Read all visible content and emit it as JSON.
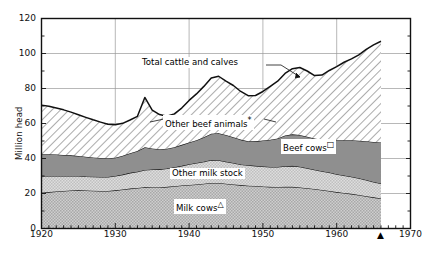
{
  "chart_data": {
    "type": "area",
    "stacked": true,
    "title": "",
    "xlabel": "",
    "ylabel": "Million head",
    "xlim": [
      1920,
      1970
    ],
    "ylim": [
      0,
      120
    ],
    "ytick_step": 20,
    "yminor_step": 10,
    "xtick_step": 10,
    "xminor_step": 1,
    "grid": "major xy",
    "legend_position": "inline-annotations",
    "x": [
      1920,
      1921,
      1922,
      1923,
      1924,
      1925,
      1926,
      1927,
      1928,
      1929,
      1930,
      1931,
      1932,
      1933,
      1934,
      1935,
      1936,
      1937,
      1938,
      1939,
      1940,
      1941,
      1942,
      1943,
      1944,
      1945,
      1946,
      1947,
      1948,
      1949,
      1950,
      1951,
      1952,
      1953,
      1954,
      1955,
      1956,
      1957,
      1958,
      1959,
      1960,
      1961,
      1962,
      1963,
      1964,
      1965,
      1966
    ],
    "series": [
      {
        "name": "Milk cows",
        "symbol": "triangle",
        "fill": "#bdbdbd",
        "values": [
          20.5,
          20.8,
          21.2,
          21.5,
          21.7,
          21.8,
          21.7,
          21.6,
          21.5,
          21.5,
          21.8,
          22.3,
          22.8,
          23.2,
          23.6,
          23.5,
          23.5,
          23.8,
          24.2,
          24.6,
          24.9,
          25.2,
          25.6,
          26.0,
          26.0,
          25.6,
          25.2,
          24.8,
          24.5,
          24.3,
          24.0,
          23.8,
          23.7,
          23.8,
          23.8,
          23.5,
          23.0,
          22.6,
          22.0,
          21.5,
          20.8,
          20.3,
          19.8,
          19.2,
          18.5,
          17.8,
          17.2
        ]
      },
      {
        "name": "Other milk stock",
        "symbol": "",
        "fill": "#d4d4d4",
        "values": [
          9.5,
          9.2,
          8.8,
          8.5,
          8.3,
          8.2,
          8.0,
          8.0,
          8.0,
          8.0,
          8.2,
          8.5,
          9.0,
          9.3,
          9.8,
          10.2,
          10.3,
          10.5,
          10.8,
          11.2,
          11.8,
          12.2,
          12.6,
          13.2,
          13.0,
          12.6,
          12.2,
          11.8,
          11.6,
          11.5,
          11.5,
          11.4,
          11.5,
          11.8,
          12.0,
          11.8,
          11.5,
          11.0,
          10.7,
          10.5,
          10.2,
          10.0,
          9.8,
          9.5,
          9.2,
          8.8,
          8.5
        ]
      },
      {
        "name": "Beef cows",
        "symbol": "square",
        "fill": "#8f8f8f",
        "values": [
          12.5,
          12.5,
          12.3,
          12.0,
          11.8,
          11.5,
          11.3,
          11.0,
          10.8,
          10.6,
          10.5,
          10.8,
          11.2,
          11.8,
          13.0,
          12.0,
          11.5,
          11.3,
          11.5,
          12.0,
          12.5,
          13.0,
          14.0,
          15.0,
          15.5,
          15.2,
          14.8,
          14.2,
          13.8,
          14.0,
          14.8,
          15.5,
          16.2,
          17.5,
          18.0,
          18.2,
          18.0,
          17.8,
          18.0,
          18.8,
          19.5,
          20.2,
          20.8,
          21.5,
          22.2,
          22.8,
          23.5
        ]
      },
      {
        "name": "Other beef animals",
        "symbol": "asterisk",
        "fill": "#ffffff",
        "hatch": "diagonal",
        "values": [
          28.0,
          27.3,
          26.5,
          25.8,
          24.7,
          23.5,
          22.5,
          21.5,
          20.5,
          19.5,
          18.8,
          18.5,
          19.0,
          19.8,
          28.5,
          22.0,
          19.8,
          18.5,
          19.0,
          21.0,
          24.0,
          26.5,
          29.0,
          31.8,
          32.5,
          30.8,
          29.5,
          27.5,
          26.0,
          26.2,
          28.0,
          30.5,
          32.8,
          35.5,
          37.5,
          38.5,
          37.5,
          36.0,
          37.0,
          39.5,
          42.0,
          44.5,
          46.5,
          49.0,
          52.5,
          55.5,
          57.8
        ]
      }
    ],
    "total_series": {
      "name": "Total cattle and calves",
      "values": [
        70.5,
        69.8,
        68.8,
        67.8,
        66.5,
        65.0,
        63.5,
        62.1,
        60.8,
        59.6,
        59.3,
        60.1,
        62.0,
        64.1,
        74.9,
        67.7,
        65.1,
        64.1,
        65.5,
        68.8,
        73.2,
        76.9,
        81.2,
        86.0,
        87.0,
        84.2,
        81.7,
        78.3,
        75.9,
        76.0,
        78.3,
        81.2,
        84.2,
        88.6,
        91.3,
        92.0,
        90.0,
        87.4,
        87.7,
        90.3,
        92.5,
        95.0,
        96.9,
        99.2,
        102.4,
        104.9,
        107.0
      ]
    },
    "annotations": [
      {
        "id": "total",
        "text": "Total cattle and calves",
        "symbol": ""
      },
      {
        "id": "otherbeef",
        "text": "Other beef animals",
        "symbol": "*"
      },
      {
        "id": "beefcows",
        "text": "Beef cows",
        "symbol": "□"
      },
      {
        "id": "othermilk",
        "text": "Other milk stock",
        "symbol": ""
      },
      {
        "id": "milkcows",
        "text": "Milk cows",
        "symbol": "△"
      }
    ],
    "ytick_labels": [
      "0",
      "20",
      "40",
      "60",
      "80",
      "100",
      "120"
    ],
    "xtick_labels": [
      "1920",
      "1930",
      "1940",
      "1950",
      "1960",
      "1970"
    ],
    "axis_marker": {
      "glyph": "▲",
      "year": 1966
    }
  }
}
